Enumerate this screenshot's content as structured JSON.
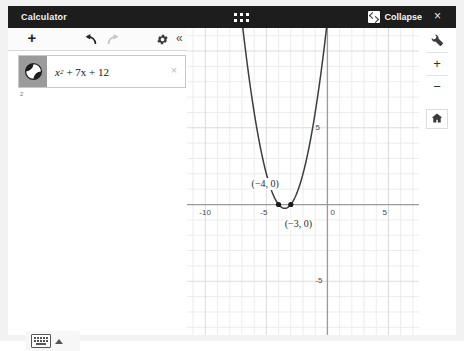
{
  "window": {
    "title": "Calculator",
    "drag_handle_icon": "grid-dots-icon",
    "collapse_label": "Collapse",
    "collapse_icon": "collapse-window-icon",
    "close_label": "×",
    "close_icon": "close-icon"
  },
  "expression_panel": {
    "toolbar": {
      "add_label": "+",
      "add_icon": "plus-icon",
      "undo_icon": "undo-arrow-icon",
      "redo_icon": "redo-arrow-icon",
      "settings_icon": "gear-icon",
      "collapse_label": "«",
      "collapse_icon": "double-chevron-left-icon"
    },
    "rows": [
      {
        "marker_icon": "curve-graph-icon",
        "expression_base": "x",
        "expression_exponent": "2",
        "expression_rest": "+ 7x + 12",
        "expression_plain": "x² + 7x + 12",
        "delete_label": "×",
        "delete_icon": "close-icon"
      }
    ],
    "next_row_number": "2",
    "keyboard_icon": "keyboard-icon",
    "keyboard_caret_icon": "caret-up-icon"
  },
  "graph_tools": {
    "settings_icon": "wrench-icon",
    "zoom_in_label": "+",
    "zoom_in_icon": "plus-icon",
    "zoom_out_label": "−",
    "zoom_out_icon": "minus-icon",
    "home_icon": "home-icon"
  },
  "colors": {
    "header_bg": "#1d1d1d",
    "header_text": "#f4f4f4",
    "panel_bg": "#ffffff",
    "grid_minor": "#ececec",
    "grid_major": "#d8d8d8",
    "axis": "#999999",
    "curve": "#3a3a3a",
    "point": "#1a1a1a"
  },
  "chart_data": {
    "type": "line",
    "title": "",
    "xlabel": "",
    "ylabel": "",
    "equation": "y = x^2 + 7x + 12",
    "coefficients": {
      "a": 1,
      "b": 7,
      "c": 12
    },
    "xlim": [
      -11.5,
      7.5
    ],
    "ylim": [
      -8.5,
      11.5
    ],
    "grid": true,
    "grid_minor_step": 1,
    "grid_major_step": 5,
    "xticks": [
      -10,
      -5,
      0,
      5
    ],
    "yticks": [
      5,
      0,
      -5
    ],
    "xtick_labels": [
      "-10",
      "-5",
      "0",
      "5"
    ],
    "ytick_labels": [
      "5",
      "0",
      "-5"
    ],
    "annotations": [
      {
        "label": "(−4, 0)",
        "x": -4,
        "y": 0
      },
      {
        "label": "(−3, 0)",
        "x": -3,
        "y": 0
      }
    ],
    "points": [
      {
        "x": -4,
        "y": 0
      },
      {
        "x": -3,
        "y": 0
      }
    ],
    "vertex": {
      "x": -3.5,
      "y": -0.25
    },
    "roots": [
      -4,
      -3
    ]
  }
}
